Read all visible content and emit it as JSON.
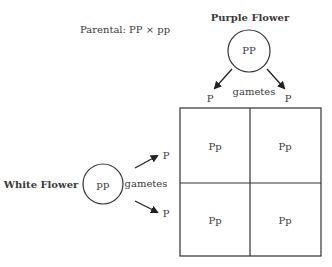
{
  "parental": {
    "label": "Parental: PP × pp"
  },
  "purple_parent": {
    "title": "Purple Flower",
    "genotype": "PP",
    "gametes_label": "gametes",
    "gametes": [
      "P",
      "P"
    ]
  },
  "white_parent": {
    "title": "White Flower",
    "genotype": "pp",
    "gametes_label": "gametes",
    "gametes": [
      "P",
      "P"
    ]
  },
  "punnett": {
    "cells": [
      [
        "Pp",
        "Pp"
      ],
      [
        "Pp",
        "Pp"
      ]
    ]
  },
  "colors": {
    "ink": "#3a3a3a",
    "line": "#333333"
  }
}
